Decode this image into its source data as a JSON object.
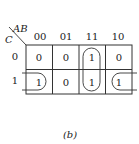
{
  "kmap": {
    "row_var": "C",
    "col_vars": "AB",
    "col_headers": [
      "00",
      "01",
      "11",
      "10"
    ],
    "row_headers": [
      "0",
      "1"
    ],
    "cells": [
      [
        "0",
        "0",
        "1",
        "0"
      ],
      [
        "1",
        "0",
        "1",
        "1"
      ]
    ],
    "groups": [
      {
        "name": "column-11-pair",
        "cells": [
          [
            0,
            2
          ],
          [
            1,
            2
          ]
        ]
      },
      {
        "name": "wraparound-row1-00-10",
        "cells": [
          [
            1,
            0
          ],
          [
            1,
            3
          ]
        ]
      }
    ]
  },
  "caption": "(b)"
}
